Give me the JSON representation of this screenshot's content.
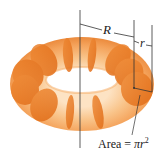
{
  "diagram": {
    "labels": {
      "major_radius": "R",
      "minor_radius": "r",
      "area_prefix": "Area = ",
      "area_pi": "π",
      "area_r": "r",
      "area_exp": "2"
    },
    "colors": {
      "torus_light": "#f9c48a",
      "torus_mid": "#f4a25a",
      "torus_dark": "#e8792a",
      "slice_fill": "#e8761f",
      "line": "#333333",
      "background": "#ffffff"
    }
  }
}
